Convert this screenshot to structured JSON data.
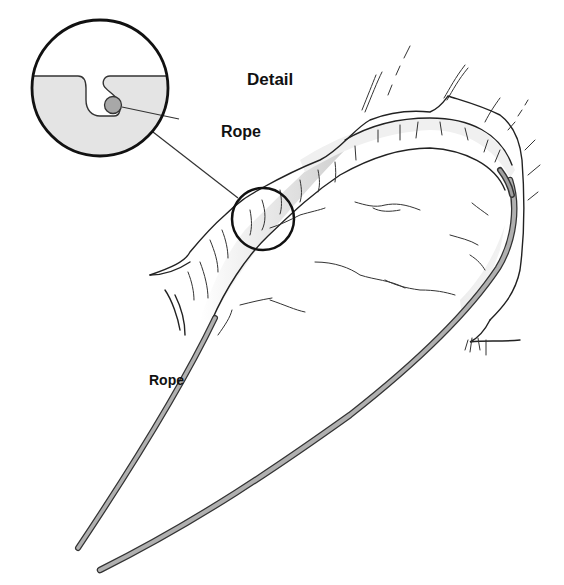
{
  "diagram": {
    "type": "illustration",
    "labels": {
      "detail": "Detail",
      "rope_callout": "Rope",
      "rope_main": "Rope"
    },
    "colors": {
      "line": "#222222",
      "rope_fill": "#b0b0b0",
      "rock_shade": "#d8d8d8",
      "detail_fill": "#e4e4e4",
      "rope_cross_section": "#a8a8a8",
      "background": "#ffffff"
    }
  }
}
